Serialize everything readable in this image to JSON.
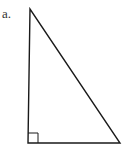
{
  "figure": {
    "label": "a.",
    "shape": "right-triangle",
    "right_angle_marker": true,
    "stroke_color": "#1a1a1a",
    "background": "#ffffff"
  }
}
